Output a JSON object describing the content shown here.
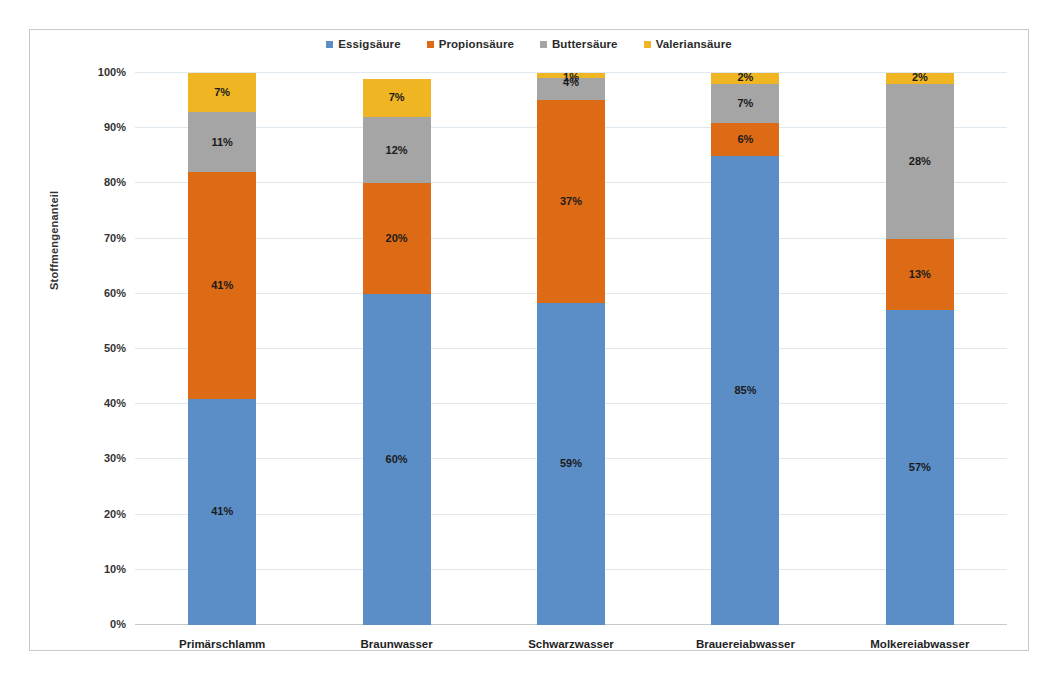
{
  "chart_data": {
    "type": "bar",
    "subtype": "stacked-100-percent",
    "title": "",
    "xlabel": "",
    "ylabel": "Stoffmengenanteil",
    "ylim": [
      0,
      100
    ],
    "ytick_labels": [
      "0%",
      "10%",
      "20%",
      "30%",
      "40%",
      "50%",
      "60%",
      "70%",
      "80%",
      "90%",
      "100%"
    ],
    "ytick_values": [
      0,
      10,
      20,
      30,
      40,
      50,
      60,
      70,
      80,
      90,
      100
    ],
    "grid": true,
    "legend_position": "top-center",
    "categories": [
      "Primärschlamm",
      "Braunwasser",
      "Schwarzwasser",
      "Brauereiabwasser",
      "Molkereiabwasser"
    ],
    "series": [
      {
        "name": "Essigsäure",
        "color": "#5b8ec6",
        "values": [
          41,
          60,
          59,
          85,
          57
        ],
        "labels": [
          "41%",
          "60%",
          "59%",
          "85%",
          "57%"
        ]
      },
      {
        "name": "Propionsäure",
        "color": "#dd6b15",
        "values": [
          41,
          20,
          37,
          6,
          13
        ],
        "labels": [
          "41%",
          "20%",
          "37%",
          "6%",
          "13%"
        ]
      },
      {
        "name": "Buttersäure",
        "color": "#a5a5a5",
        "values": [
          11,
          12,
          4,
          7,
          28
        ],
        "labels": [
          "11%",
          "12%",
          "4%",
          "7%",
          "28%"
        ]
      },
      {
        "name": "Valeriansäure",
        "color": "#efb522",
        "values": [
          7,
          7,
          1,
          2,
          2
        ],
        "labels": [
          "7%",
          "7%",
          "1%",
          "2%",
          "2%"
        ]
      }
    ]
  },
  "legend": {
    "items": [
      {
        "label": "Essigsäure",
        "color": "#5b8ec6"
      },
      {
        "label": "Propionsäure",
        "color": "#dd6b15"
      },
      {
        "label": "Buttersäure",
        "color": "#a5a5a5"
      },
      {
        "label": "Valeriansäure",
        "color": "#efb522"
      }
    ]
  },
  "axes": {
    "y_title": "Stoffmengenanteil"
  }
}
